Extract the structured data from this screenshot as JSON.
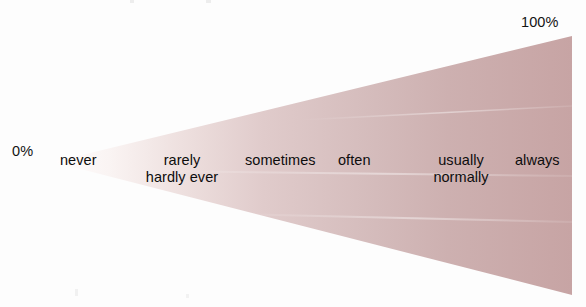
{
  "diagram": {
    "type": "frequency-cone-scale",
    "orientation": "horizontal",
    "scale": {
      "min_label": "0%",
      "max_label": "100%",
      "min_value": 0,
      "max_value": 100
    },
    "colors": {
      "cone_apex": "#fbf7f6",
      "cone_mid": "#ddc8c8",
      "cone_base": "#c8a6a6",
      "cone_edge": "#c09e9e",
      "text": "#0d0d0d",
      "background": "#fdfdfd"
    },
    "items": [
      {
        "label": "never",
        "alt": "",
        "approx_percent": 0
      },
      {
        "label": "rarely",
        "alt": "hardly ever",
        "approx_percent": 15
      },
      {
        "label": "sometimes",
        "alt": "",
        "approx_percent": 40
      },
      {
        "label": "often",
        "alt": "",
        "approx_percent": 60
      },
      {
        "label": "usually",
        "alt": "normally",
        "approx_percent": 85
      },
      {
        "label": "always",
        "alt": "",
        "approx_percent": 100
      }
    ]
  }
}
